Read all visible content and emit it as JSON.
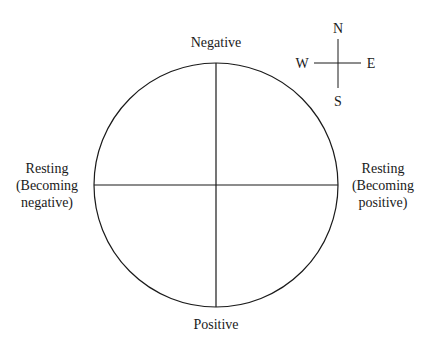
{
  "diagram": {
    "labels": {
      "top": "Negative",
      "bottom": "Positive",
      "left": [
        "Resting",
        "(Becoming",
        "negative)"
      ],
      "right": [
        "Resting",
        "(Becoming",
        "positive)"
      ]
    },
    "compass": {
      "north": "N",
      "south": "S",
      "east": "E",
      "west": "W"
    },
    "circle": {
      "cx": 216,
      "cy": 185,
      "r": 122
    },
    "line_color": "#1a1a1a"
  }
}
